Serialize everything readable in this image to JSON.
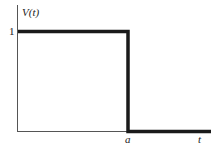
{
  "diagram": {
    "type": "step_function",
    "y_label": "V(t)",
    "x_label": "t",
    "y_tick_label": "1",
    "x_marker_label": "a",
    "colors": {
      "axis": "#555555",
      "curve": "#1a1a1a",
      "background": "#ffffff"
    }
  }
}
